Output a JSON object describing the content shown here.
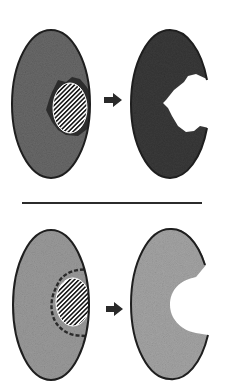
{
  "diagram": {
    "colors": {
      "background": "#ffffff",
      "outline": "#1e1e1e",
      "tissue_dark": "#3a3a3a",
      "tissue_medium": "#6e6e6e",
      "tissue_light": "#a4a4a4",
      "hatch_dark": "#1a1a1a",
      "hatch_light": "#ffffff",
      "arrow": "#2a2a2a",
      "divider": "#2b2b2b"
    },
    "rows": [
      {
        "id": "top",
        "before": {
          "shape": "ellipse",
          "fill": "medium-dark stippled",
          "lesion": "hatched ellipse with dark irregular halo"
        },
        "arrow": "right-arrow",
        "after": {
          "shape": "ellipse with irregular jagged cavity on right",
          "fill": "dark stippled"
        }
      },
      {
        "id": "bottom",
        "before": {
          "shape": "ellipse",
          "fill": "light stippled",
          "lesion": "hatched ellipse with dashed margin"
        },
        "arrow": "right-arrow",
        "after": {
          "shape": "ellipse with smooth C-shaped cavity on right",
          "fill": "light stippled"
        }
      }
    ],
    "divider": "horizontal-line"
  }
}
